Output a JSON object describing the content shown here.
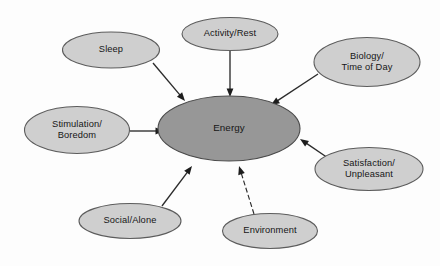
{
  "diagram": {
    "type": "radial-concept-map",
    "background_color": "#fdfdfd",
    "center_node": {
      "id": "energy",
      "label": "Energy",
      "cx": 229,
      "cy": 128.5,
      "rx": 71,
      "ry": 32.5,
      "fill": "#979797",
      "stroke": "#4a4a4a",
      "text_color": "#161616"
    },
    "satellite_fill": "#cfcfcf",
    "satellite_stroke": "#5c5c5c",
    "edge_color": "#1d1d1d",
    "nodes": [
      {
        "id": "sleep",
        "lines": [
          "Sleep"
        ],
        "cx": 111,
        "cy": 50,
        "rx": 48.5,
        "ry": 18
      },
      {
        "id": "activity-rest",
        "lines": [
          "Activity/Rest"
        ],
        "cx": 230,
        "cy": 34,
        "rx": 48,
        "ry": 16.5
      },
      {
        "id": "biology-time-of-day",
        "lines": [
          "Biology/",
          "Time of Day"
        ],
        "cx": 367,
        "cy": 62,
        "rx": 53,
        "ry": 24.5
      },
      {
        "id": "stimulation-boredom",
        "lines": [
          "Stimulation/",
          "Boredom"
        ],
        "cx": 77,
        "cy": 130,
        "rx": 52.5,
        "ry": 23.5
      },
      {
        "id": "satisfaction-unpleasant",
        "lines": [
          "Satisfaction/",
          "Unpleasant"
        ],
        "cx": 369,
        "cy": 169,
        "rx": 54,
        "ry": 21.5
      },
      {
        "id": "social-alone",
        "lines": [
          "Social/Alone"
        ],
        "cx": 130,
        "cy": 221,
        "rx": 51,
        "ry": 17.5
      },
      {
        "id": "environment",
        "lines": [
          "Environment"
        ],
        "cx": 270,
        "cy": 231,
        "rx": 47.5,
        "ry": 17.5
      }
    ],
    "edges": [
      {
        "id": "sleep-to-energy",
        "from": "sleep",
        "to": "energy",
        "x1": 153,
        "y1": 63,
        "x2": 185,
        "y2": 101,
        "style": "solid",
        "arrow": "end"
      },
      {
        "id": "activity-rest-to-energy",
        "from": "activity-rest",
        "to": "energy",
        "x1": 230,
        "y1": 51,
        "x2": 230,
        "y2": 97,
        "style": "solid",
        "arrow": "end"
      },
      {
        "id": "biology-to-energy",
        "from": "biology-time-of-day",
        "to": "energy",
        "x1": 318,
        "y1": 74,
        "x2": 271,
        "y2": 105,
        "style": "solid",
        "arrow": "end"
      },
      {
        "id": "stimulation-to-energy",
        "from": "stimulation-boredom",
        "to": "energy",
        "x1": 130,
        "y1": 131,
        "x2": 164,
        "y2": 131,
        "style": "solid",
        "arrow": "end"
      },
      {
        "id": "satisfaction-to-energy",
        "from": "satisfaction-unpleasant",
        "to": "energy",
        "x1": 328,
        "y1": 158,
        "x2": 300,
        "y2": 139,
        "style": "solid",
        "arrow": "end"
      },
      {
        "id": "social-to-energy",
        "from": "social-alone",
        "to": "energy",
        "x1": 162,
        "y1": 206,
        "x2": 192,
        "y2": 166,
        "style": "solid",
        "arrow": "end"
      },
      {
        "id": "environment-to-energy",
        "from": "environment",
        "to": "energy",
        "x1": 254,
        "y1": 214,
        "x2": 239,
        "y2": 166,
        "style": "dashed",
        "arrow": "end"
      }
    ]
  }
}
